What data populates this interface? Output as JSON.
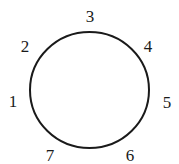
{
  "diagram": {
    "shape": "circle",
    "stroke_color": "#1a1a1a",
    "labels": [
      {
        "id": "1",
        "text": "1"
      },
      {
        "id": "2",
        "text": "2"
      },
      {
        "id": "3",
        "text": "3"
      },
      {
        "id": "4",
        "text": "4"
      },
      {
        "id": "5",
        "text": "5"
      },
      {
        "id": "6",
        "text": "6"
      },
      {
        "id": "7",
        "text": "7"
      }
    ]
  }
}
